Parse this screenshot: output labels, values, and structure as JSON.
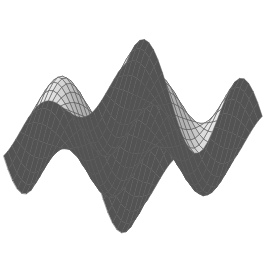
{
  "figure": {
    "kind": "3d-surface-wireframe-plot",
    "title": "",
    "caption": "",
    "background_color": "#ffffff",
    "width_px": 267,
    "height_px": 273
  },
  "chart_data": {
    "type": "surface",
    "title": "",
    "subtitle": "",
    "xlabel": "",
    "ylabel": "",
    "zlabel": "",
    "axes_visible": false,
    "grid": true,
    "legend": false,
    "legend_position": "none",
    "colormap": "grayscale",
    "surface_fill_light": "#f4f4f4",
    "surface_fill_mid": "#b4b4b4",
    "surface_fill_dark": "#7a7a7a",
    "backface_fill": "#4a4a4a",
    "mesh_line_color": "#5a5a5a",
    "mesh_line_width": 0.55,
    "xlim": [
      -3.0,
      3.0
    ],
    "ylim": [
      -3.0,
      3.0
    ],
    "zlim": [
      -1.0,
      1.0
    ],
    "mesh_nx": 30,
    "mesh_ny": 30,
    "function": "z = sin(1.45*x) * cos(1.45*y)",
    "function_terms": [
      {
        "name": "amplitude",
        "value": 1.0
      },
      {
        "name": "x_frequency",
        "value": 1.45
      },
      {
        "name": "y_frequency",
        "value": 1.45
      }
    ],
    "view": {
      "azimuth_deg": -48,
      "elevation_deg": 26,
      "roll_deg": 0,
      "projection": "orthographic",
      "scale": 30.5,
      "center_x_px": 133,
      "center_y_px": 136,
      "z_scale": 56
    },
    "lighting": {
      "model": "lambert-diffuse",
      "light_dir": [
        -0.35,
        -0.45,
        0.82
      ],
      "ambient": 0.34,
      "diffuse": 0.66
    },
    "features": [
      {
        "name": "front-left-crest",
        "description": "curled crest along left edge",
        "approx_px": [
          40,
          80
        ]
      },
      {
        "name": "top-center-crest",
        "description": "rounded mesh peak at top",
        "approx_px": [
          120,
          28
        ]
      },
      {
        "name": "dark-back-spike",
        "description": "dark back-facing spike above surface",
        "approx_px": [
          178,
          18
        ]
      },
      {
        "name": "center-saddle",
        "description": "saddle fold across middle",
        "approx_px": [
          133,
          148
        ]
      },
      {
        "name": "bottom-trough",
        "description": "bright valley at lower center",
        "approx_px": [
          105,
          215
        ]
      },
      {
        "name": "right-crest",
        "description": "pointed crest on right edge",
        "approx_px": [
          226,
          160
        ]
      }
    ]
  }
}
